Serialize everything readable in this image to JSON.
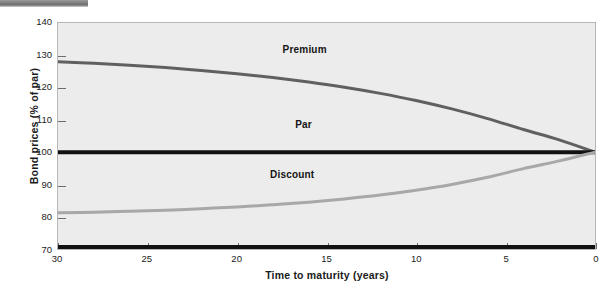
{
  "figure": {
    "background_color": "#ffffff",
    "plot_background_color": "#ececec",
    "top_rule_color": "#7d7d7d"
  },
  "chart_data": {
    "type": "line",
    "title": "",
    "subtitle": "",
    "xlabel": "Time to maturity (years)",
    "ylabel": "Bond prices (% of par)",
    "xlim": [
      30,
      0
    ],
    "ylim": [
      70,
      140
    ],
    "x_reversed": true,
    "grid": false,
    "legend": "inline-annotations",
    "xticks": [
      30,
      25,
      20,
      15,
      10,
      5,
      0
    ],
    "xtick_labels": [
      "30",
      "25",
      "20",
      "15",
      "10",
      "5",
      "0"
    ],
    "yticks": [
      70,
      80,
      90,
      100,
      110,
      120,
      130,
      140
    ],
    "ytick_labels": [
      "70",
      "80",
      "90",
      "100",
      "110",
      "120",
      "130",
      "140"
    ],
    "x": [
      30,
      28,
      26,
      24,
      22,
      20,
      18,
      16,
      14,
      12,
      10,
      8,
      6,
      4,
      2,
      0
    ],
    "series": [
      {
        "name": "Premium",
        "color": "#606060",
        "line_width": 3,
        "values": [
          128.0,
          127.5,
          126.9,
          126.2,
          125.3,
          124.3,
          123.1,
          121.7,
          120.1,
          118.2,
          116.0,
          113.4,
          110.4,
          107.0,
          103.8,
          100.0
        ]
      },
      {
        "name": "Par",
        "color": "#111111",
        "line_width": 4,
        "values": [
          100,
          100,
          100,
          100,
          100,
          100,
          100,
          100,
          100,
          100,
          100,
          100,
          100,
          100,
          100,
          100
        ]
      },
      {
        "name": "Discount",
        "color": "#a8a8a8",
        "line_width": 3,
        "values": [
          81.2,
          81.4,
          81.7,
          82.0,
          82.5,
          83.0,
          83.7,
          84.5,
          85.5,
          86.7,
          88.2,
          90.0,
          92.2,
          94.9,
          97.3,
          100.0
        ]
      }
    ],
    "annotations": [
      {
        "text": "Premium",
        "x": 17.5,
        "y": 131.5
      },
      {
        "text": "Par",
        "x": 16.8,
        "y": 108.5
      },
      {
        "text": "Discount",
        "x": 18.2,
        "y": 93.0
      }
    ],
    "baseline_rule": {
      "y": 70,
      "color": "#111111",
      "line_width": 4
    }
  }
}
